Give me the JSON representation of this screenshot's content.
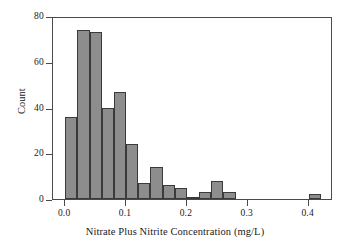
{
  "chart_data": {
    "type": "bar",
    "title": "",
    "subtitle": "",
    "xlabel": "Nitrate Plus Nitrite Concentration (mg/L)",
    "ylabel": "Count",
    "xlim": [
      -0.02,
      0.44
    ],
    "ylim": [
      0,
      80
    ],
    "xticks": [
      0.0,
      0.1,
      0.2,
      0.3,
      0.4
    ],
    "xtick_labels": [
      "0.0",
      "0.1",
      "0.2",
      "0.3",
      "0.4"
    ],
    "yticks": [
      0,
      20,
      40,
      60,
      80
    ],
    "ytick_labels": [
      "0",
      "20",
      "40",
      "60",
      "80"
    ],
    "grid": false,
    "legend": null,
    "bin_width": 0.02,
    "bar_color": "#8d8d8d",
    "bar_edge_color": "#3a3a3a",
    "frame_color": "#4a4a4a",
    "background_color": "#ffffff",
    "bins": [
      {
        "x0": 0.0,
        "x1": 0.02,
        "count": 36
      },
      {
        "x0": 0.02,
        "x1": 0.04,
        "count": 74
      },
      {
        "x0": 0.04,
        "x1": 0.06,
        "count": 73
      },
      {
        "x0": 0.06,
        "x1": 0.08,
        "count": 40
      },
      {
        "x0": 0.08,
        "x1": 0.1,
        "count": 47
      },
      {
        "x0": 0.1,
        "x1": 0.12,
        "count": 24
      },
      {
        "x0": 0.12,
        "x1": 0.14,
        "count": 7
      },
      {
        "x0": 0.14,
        "x1": 0.16,
        "count": 14
      },
      {
        "x0": 0.16,
        "x1": 0.18,
        "count": 6
      },
      {
        "x0": 0.18,
        "x1": 0.2,
        "count": 5
      },
      {
        "x0": 0.2,
        "x1": 0.22,
        "count": 1
      },
      {
        "x0": 0.22,
        "x1": 0.24,
        "count": 3
      },
      {
        "x0": 0.24,
        "x1": 0.26,
        "count": 8
      },
      {
        "x0": 0.26,
        "x1": 0.28,
        "count": 3
      },
      {
        "x0": 0.4,
        "x1": 0.42,
        "count": 2
      }
    ]
  }
}
